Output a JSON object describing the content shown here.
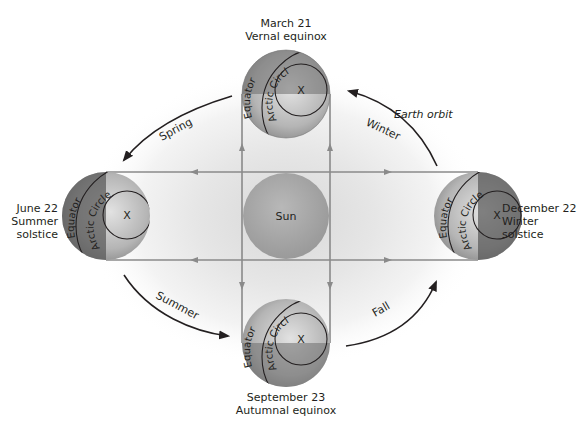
{
  "diagram": {
    "title_hidden": "Earth's orbit and seasons",
    "sun": {
      "label": "Sun",
      "color": "#a8a8a8"
    },
    "orbit_label": "Earth orbit",
    "seasons": {
      "spring": "Spring",
      "summer": "Summer",
      "fall": "Fall",
      "winter": "Winter"
    },
    "positions": {
      "top": {
        "line1": "March 21",
        "line2": "Vernal equinox"
      },
      "left": {
        "line1": "June 22",
        "line2": "Summer",
        "line3": "solstice"
      },
      "right": {
        "line1": "December 22",
        "line2": "Winter",
        "line3": "solstice"
      },
      "bottom": {
        "line1": "September 23",
        "line2": "Autumnal equinox"
      }
    },
    "globe_labels": {
      "equator": "Equator",
      "arctic_circle": "Arctic Circle",
      "pole_mark": "X"
    },
    "colors": {
      "globe_dark": "#5a5a5a",
      "globe_light": "#c8c8c8",
      "ray_line": "#8a8a8a",
      "arrow": "#231f20",
      "glow": "#d9d9d9"
    }
  }
}
